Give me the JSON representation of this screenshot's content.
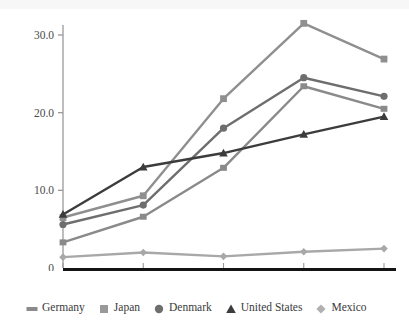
{
  "figure": {
    "title_ghost": "",
    "background": "#ffffff"
  },
  "chart_data": {
    "type": "line",
    "title": "",
    "subtitle": "",
    "xlabel": "",
    "ylabel": "",
    "categories": [
      "1975",
      "1985",
      "1990",
      "1995",
      "1999"
    ],
    "ylim": [
      0,
      33
    ],
    "yticks": [
      0,
      10,
      20,
      30
    ],
    "ytick_labels": [
      "0",
      "10.0",
      "20.0",
      "30.0"
    ],
    "grid": false,
    "legend_position": "bottom",
    "series": [
      {
        "name": "Germany",
        "marker": "rect",
        "color": "#8a8a8a",
        "values": [
          3.3,
          6.6,
          12.9,
          23.4,
          20.5
        ]
      },
      {
        "name": "Japan",
        "marker": "square",
        "color": "#8f8f8f",
        "values": [
          6.5,
          9.3,
          21.8,
          31.5,
          26.9
        ]
      },
      {
        "name": "Denmark",
        "marker": "circle",
        "color": "#6e6e6e",
        "values": [
          5.6,
          8.1,
          18.0,
          24.5,
          22.1
        ]
      },
      {
        "name": "United States",
        "marker": "triangle",
        "color": "#3c3c3c",
        "values": [
          6.9,
          13.0,
          14.8,
          17.2,
          19.5
        ]
      },
      {
        "name": "Mexico",
        "marker": "diamond",
        "color": "#a8a8a8",
        "values": [
          1.4,
          2.0,
          1.5,
          2.1,
          2.5
        ]
      }
    ]
  },
  "legend": {
    "items": [
      {
        "label": "Germany",
        "marker": "rect-marker",
        "color": "#8a8a8a"
      },
      {
        "label": "Japan",
        "marker": "square-marker",
        "color": "#9a9a9a"
      },
      {
        "label": "Denmark",
        "marker": "circle-marker",
        "color": "#6e6e6e"
      },
      {
        "label": "United States",
        "marker": "triangle-marker",
        "color": "#3c3c3c"
      },
      {
        "label": "Mexico",
        "marker": "diamond-marker",
        "color": "#b0b0b0"
      }
    ]
  },
  "axes": {
    "y_axis_color": "#9a9a9a",
    "x_axis_color": "#141414"
  }
}
